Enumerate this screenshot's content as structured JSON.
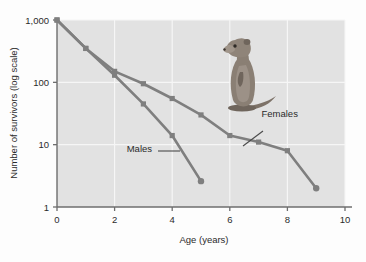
{
  "figure": {
    "background_color": "#fdfdfd",
    "plot_background_color": "#e2e2e2",
    "grid_color": "#f4f4f4",
    "axis_color": "#6e6e6e",
    "text_color": "#2b2b2b"
  },
  "illustration": {
    "name": "ground-squirrel-illustration",
    "description": "Belding's ground squirrel standing upright"
  },
  "chart_data": {
    "type": "line",
    "title": "",
    "xlabel": "Age (years)",
    "ylabel": "Number of survivors (log scale)",
    "xlim": [
      0,
      10
    ],
    "ylim": [
      1,
      1000
    ],
    "yscale": "log",
    "grid": true,
    "legend_position": "inline-annotations",
    "xticks": [
      0,
      2,
      4,
      6,
      8,
      10
    ],
    "xticklabels": [
      "0",
      "2",
      "4",
      "6",
      "8",
      "10"
    ],
    "yticks": [
      1,
      10,
      100,
      1000
    ],
    "yticklabels": [
      "1",
      "10",
      "100",
      "1,000"
    ],
    "series": [
      {
        "name": "Females",
        "color": "#7f7f7f",
        "x": [
          0,
          1,
          2,
          3,
          4,
          5,
          6,
          7,
          8,
          9
        ],
        "values": [
          1000,
          350,
          150,
          95,
          55,
          30,
          14,
          11,
          8,
          2
        ]
      },
      {
        "name": "Males",
        "color": "#7f7f7f",
        "x": [
          0,
          1,
          2,
          3,
          4,
          5
        ],
        "values": [
          1000,
          350,
          130,
          45,
          14,
          2.6
        ]
      }
    ],
    "annotations": [
      {
        "text": "Females",
        "x": 7.1,
        "y": 28
      },
      {
        "text": "Males",
        "x": 3.3,
        "y": 7.5
      }
    ]
  }
}
